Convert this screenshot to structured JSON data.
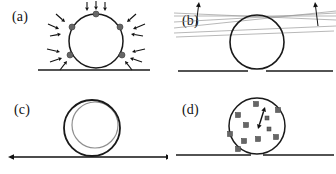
{
  "figure": {
    "width": 336,
    "height": 174,
    "background": "#ffffff",
    "ink_color": "#1a1a1a",
    "particle_color": "#666666",
    "faint_line_color": "#9a9a9a",
    "inner_circle_color": "#8f8f8f"
  },
  "panels": [
    {
      "id": "a",
      "label": "(a)",
      "label_x": 12,
      "label_y": 22,
      "description": "droplet circle on substrate with inward-pointing force arrows at contact points",
      "circle": {
        "cx": 96,
        "cy": 41,
        "r": 27
      },
      "substrate": {
        "x1": 38,
        "y1": 70,
        "x2": 150,
        "y2": 70
      },
      "contact_dots": [
        {
          "cx": 96,
          "cy": 14
        },
        {
          "cx": 72,
          "cy": 27
        },
        {
          "cx": 120,
          "cy": 27
        },
        {
          "cx": 70,
          "cy": 55
        },
        {
          "cx": 122,
          "cy": 55
        }
      ],
      "arrows": [
        {
          "x1": 87,
          "y1": 2,
          "x2": 87,
          "y2": 11
        },
        {
          "x1": 96,
          "y1": 1,
          "x2": 96,
          "y2": 10
        },
        {
          "x1": 105,
          "y1": 2,
          "x2": 105,
          "y2": 11
        },
        {
          "x1": 56,
          "y1": 14,
          "x2": 65,
          "y2": 22
        },
        {
          "x1": 48,
          "y1": 24,
          "x2": 59,
          "y2": 29
        },
        {
          "x1": 50,
          "y1": 36,
          "x2": 61,
          "y2": 34
        },
        {
          "x1": 136,
          "y1": 14,
          "x2": 127,
          "y2": 22
        },
        {
          "x1": 145,
          "y1": 24,
          "x2": 133,
          "y2": 29
        },
        {
          "x1": 143,
          "y1": 36,
          "x2": 131,
          "y2": 34
        },
        {
          "x1": 47,
          "y1": 49,
          "x2": 60,
          "y2": 52
        },
        {
          "x1": 50,
          "y1": 62,
          "x2": 62,
          "y2": 58
        },
        {
          "x1": 60,
          "y1": 70,
          "x2": 67,
          "y2": 61
        },
        {
          "x1": 145,
          "y1": 49,
          "x2": 132,
          "y2": 52
        },
        {
          "x1": 142,
          "y1": 62,
          "x2": 130,
          "y2": 58
        },
        {
          "x1": 132,
          "y1": 70,
          "x2": 125,
          "y2": 61
        }
      ]
    },
    {
      "id": "b",
      "label": "(b)",
      "label_x": 14,
      "label_y": 26,
      "description": "circle tangent to fan of faint lines at apex with two upward arrows; substrate split beneath",
      "circle": {
        "cx": 89,
        "cy": 42,
        "r": 27
      },
      "substrate_left": {
        "x1": 10,
        "y1": 71,
        "x2": 80,
        "y2": 71
      },
      "substrate_right": {
        "x1": 98,
        "y1": 71,
        "x2": 165,
        "y2": 71
      },
      "apex": {
        "x": 89,
        "y": 15
      },
      "fan_lines": [
        {
          "x1": 6,
          "y1": 16,
          "x2": 168,
          "y2": 16
        },
        {
          "x1": 6,
          "y1": 13,
          "x2": 168,
          "y2": 20
        },
        {
          "x1": 6,
          "y1": 22,
          "x2": 168,
          "y2": 13
        },
        {
          "x1": 6,
          "y1": 28,
          "x2": 168,
          "y2": 11
        },
        {
          "x1": 6,
          "y1": 33,
          "x2": 168,
          "y2": 26
        },
        {
          "x1": 8,
          "y1": 37,
          "x2": 166,
          "y2": 31
        }
      ],
      "arrows": [
        {
          "x1": 28,
          "y1": 26,
          "x2": 31,
          "y2": 2
        },
        {
          "x1": 150,
          "y1": 26,
          "x2": 147,
          "y2": 2
        }
      ]
    },
    {
      "id": "c",
      "label": "(c)",
      "label_x": 14,
      "label_y": 28,
      "description": "outer dark circle with offset lighter inner circle, cusp contact, double-headed horizontal arrow along substrate",
      "outer_circle": {
        "cx": 92,
        "cy": 41,
        "r": 28
      },
      "inner_circle": {
        "cx": 95,
        "cy": 38,
        "r": 23
      },
      "substrate_arrow": {
        "x1": 8,
        "y1": 70,
        "x2": 172,
        "y2": 70,
        "double_headed": true
      }
    },
    {
      "id": "d",
      "label": "(d)",
      "label_x": 14,
      "label_y": 28,
      "description": "circle filled with scattered square particles and a small double-headed arrow, resting on split substrate",
      "circle": {
        "cx": 89,
        "cy": 39,
        "r": 28
      },
      "substrate_left": {
        "x1": 8,
        "y1": 68,
        "x2": 83,
        "y2": 68
      },
      "substrate_right": {
        "x1": 95,
        "y1": 68,
        "x2": 166,
        "y2": 68
      },
      "particles": [
        {
          "x": 88,
          "y": 17,
          "s": 5
        },
        {
          "x": 110,
          "y": 23,
          "s": 5
        },
        {
          "x": 70,
          "y": 28,
          "s": 5
        },
        {
          "x": 99,
          "y": 31,
          "s": 4
        },
        {
          "x": 78,
          "y": 38,
          "s": 5
        },
        {
          "x": 62,
          "y": 47,
          "s": 5
        },
        {
          "x": 76,
          "y": 54,
          "s": 5
        },
        {
          "x": 90,
          "y": 52,
          "s": 5
        },
        {
          "x": 108,
          "y": 50,
          "s": 5
        },
        {
          "x": 70,
          "y": 62,
          "s": 5
        },
        {
          "x": 101,
          "y": 42,
          "s": 4
        }
      ],
      "inner_arrow": {
        "x1": 97,
        "y1": 20,
        "x2": 90,
        "y2": 42,
        "double_headed": true
      }
    }
  ]
}
